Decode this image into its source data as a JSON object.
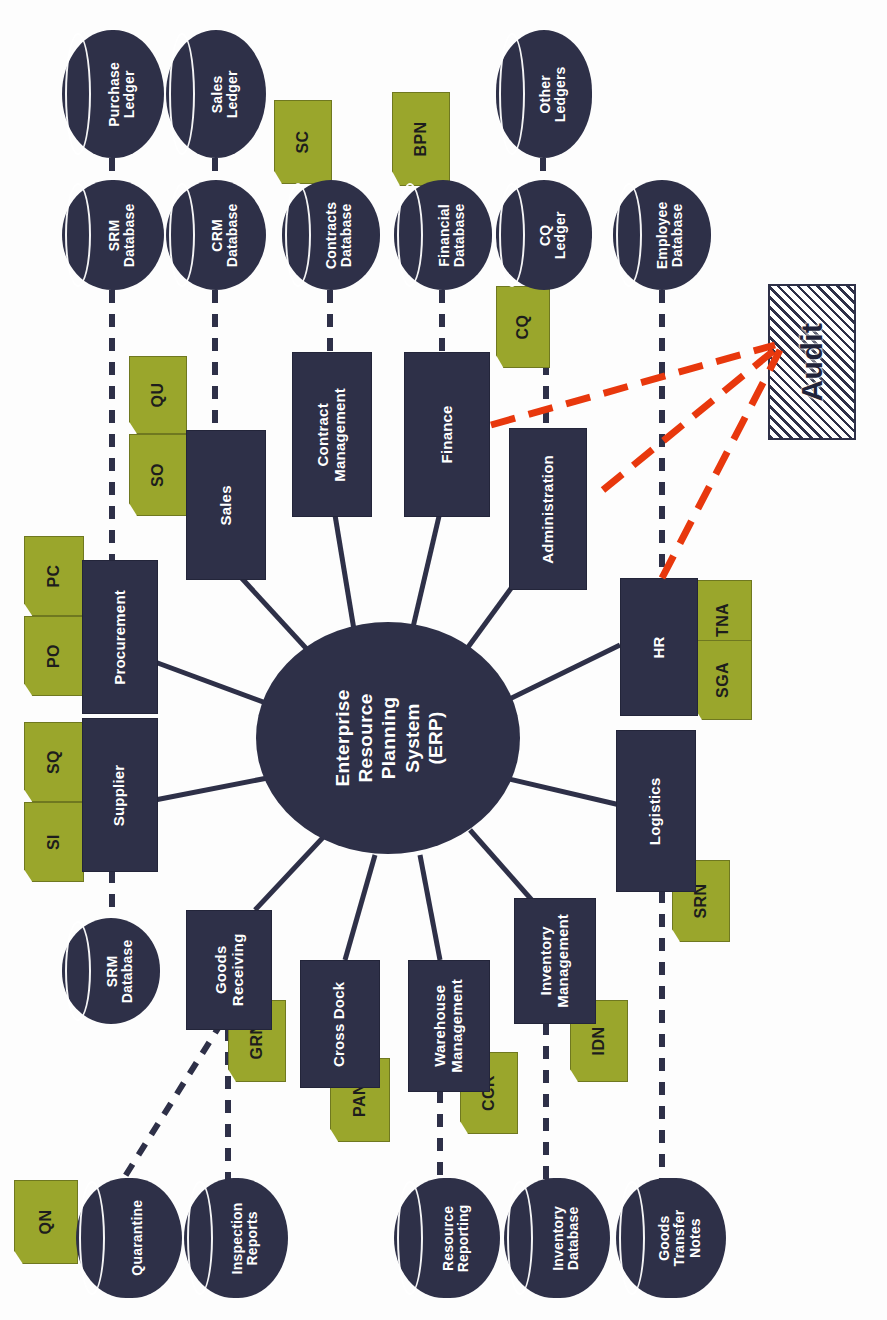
{
  "diagram": {
    "orientation": "rotated-90-ccw",
    "colors": {
      "module_fill": "#2e3048",
      "tag_fill": "#9aa62c",
      "audit_outline": "#2e3048",
      "audit_link": "#e8380d",
      "connector": "#2e3048",
      "background": "#ffffff"
    }
  },
  "hub": {
    "label": "Enterprise\nResource\nPlanning\nSystem\n(ERP)",
    "lines": [
      "Enterprise",
      "Resource",
      "Planning",
      "System",
      "(ERP)"
    ]
  },
  "modules": [
    {
      "id": "sales",
      "label": "Sales"
    },
    {
      "id": "contract",
      "label": "Contract\nManagement"
    },
    {
      "id": "finance",
      "label": "Finance"
    },
    {
      "id": "admin",
      "label": "Administration"
    },
    {
      "id": "procurement",
      "label": "Procurement"
    },
    {
      "id": "supplier",
      "label": "Supplier"
    },
    {
      "id": "hr",
      "label": "HR"
    },
    {
      "id": "logistics",
      "label": "Logistics"
    },
    {
      "id": "goods",
      "label": "Goods\nReceiving"
    },
    {
      "id": "crossdock",
      "label": "Cross Dock"
    },
    {
      "id": "warehouse",
      "label": "Warehouse\nManagement"
    },
    {
      "id": "inventory",
      "label": "Inventory\nManagement"
    }
  ],
  "databases": [
    {
      "id": "purchase-ledger",
      "label": "Purchase\nLedger"
    },
    {
      "id": "sales-ledger",
      "label": "Sales\nLedger"
    },
    {
      "id": "other-ledgers",
      "label": "Other\nLedgers"
    },
    {
      "id": "srm-database-top",
      "label": "SRM\nDatabase"
    },
    {
      "id": "crm-database",
      "label": "CRM\nDatabase"
    },
    {
      "id": "contracts-database",
      "label": "Contracts\nDatabase"
    },
    {
      "id": "financial-database",
      "label": "Financial\nDatabase"
    },
    {
      "id": "cq-ledger",
      "label": "CQ\nLedger"
    },
    {
      "id": "employee-database",
      "label": "Employee\nDatabase"
    },
    {
      "id": "srm-database-lower",
      "label": "SRM\nDatabase"
    },
    {
      "id": "quarantine",
      "label": "Quarantine"
    },
    {
      "id": "inspection-reports",
      "label": "Inspection\nReports"
    },
    {
      "id": "resource-reporting",
      "label": "Resource\nReporting"
    },
    {
      "id": "inventory-database",
      "label": "Inventory\nDatabase"
    },
    {
      "id": "goods-transfer",
      "label": "Goods\nTransfer\nNotes"
    }
  ],
  "tags": [
    {
      "id": "sc",
      "label": "SC",
      "attached_to": "contracts-database"
    },
    {
      "id": "bpn",
      "label": "BPN",
      "attached_to": "financial-database"
    },
    {
      "id": "cq",
      "label": "CQ",
      "attached_to": "cq-ledger"
    },
    {
      "id": "qu",
      "label": "QU",
      "attached_to": "sales"
    },
    {
      "id": "so",
      "label": "SO",
      "attached_to": "sales"
    },
    {
      "id": "pc",
      "label": "PC",
      "attached_to": "procurement"
    },
    {
      "id": "po",
      "label": "PO",
      "attached_to": "procurement"
    },
    {
      "id": "sq",
      "label": "SQ",
      "attached_to": "supplier"
    },
    {
      "id": "si",
      "label": "SI",
      "attached_to": "supplier"
    },
    {
      "id": "tna",
      "label": "TNA",
      "attached_to": "hr"
    },
    {
      "id": "sga",
      "label": "SGA",
      "attached_to": "hr"
    },
    {
      "id": "srn",
      "label": "SRN",
      "attached_to": "logistics"
    },
    {
      "id": "grn",
      "label": "GRN",
      "attached_to": "goods-receiving"
    },
    {
      "id": "pan",
      "label": "PAN",
      "attached_to": "cross-dock"
    },
    {
      "id": "ccr",
      "label": "CCR",
      "attached_to": "warehouse-management"
    },
    {
      "id": "idn",
      "label": "IDN",
      "attached_to": "inventory-management"
    },
    {
      "id": "qn",
      "label": "QN",
      "attached_to": "quarantine"
    }
  ],
  "audit": {
    "label": "Audit",
    "links_to": [
      "Finance",
      "Administration",
      "HR"
    ]
  }
}
